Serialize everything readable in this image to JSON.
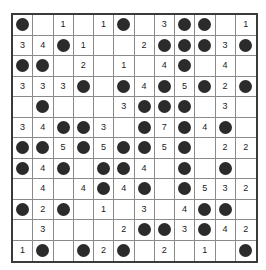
{
  "puzzle": {
    "type": "dot-and-number-grid-puzzle",
    "rows": 12,
    "columns": 12,
    "colors": {
      "dot": "#2b2b2b",
      "cell_background": "#ffffff",
      "inner_grid_line": "#8a8a8a",
      "outer_border": "#3a3a3a",
      "number_text": "#1a1a1a",
      "page_background": "#ffffff"
    },
    "legend": {
      "dot_symbol": "●",
      "blank_symbol": ""
    },
    "cells": [
      [
        "●",
        "",
        "1",
        "",
        "1",
        "●",
        "",
        "3",
        "●",
        "●",
        "",
        "1"
      ],
      [
        "3",
        "4",
        "●",
        "1",
        "",
        "",
        "2",
        "●",
        "●",
        "●",
        "3",
        "●"
      ],
      [
        "●",
        "●",
        "",
        "2",
        "",
        "1",
        "",
        "4",
        "●",
        "",
        "4",
        ""
      ],
      [
        "3",
        "3",
        "3",
        "●",
        "",
        "●",
        "4",
        "●",
        "5",
        "●",
        "2",
        "●"
      ],
      [
        "",
        "●",
        "",
        "",
        "",
        "3",
        "●",
        "●",
        "●",
        "",
        "3",
        ""
      ],
      [
        "3",
        "4",
        "●",
        "●",
        "3",
        "",
        "●",
        "7",
        "●",
        "4",
        "●",
        ""
      ],
      [
        "●",
        "●",
        "5",
        "●",
        "5",
        "●",
        "●",
        "5",
        "●",
        "",
        "2",
        "2"
      ],
      [
        "●",
        "4",
        "●",
        "",
        "●",
        "●",
        "4",
        "",
        "●",
        "",
        "●",
        ""
      ],
      [
        "",
        "4",
        "",
        "4",
        "●",
        "4",
        "●",
        "",
        "●",
        "5",
        "3",
        "2"
      ],
      [
        "●",
        "2",
        "●",
        "",
        "1",
        "",
        "3",
        "",
        "4",
        "●",
        "●",
        ""
      ],
      [
        "",
        "3",
        "",
        "",
        "",
        "2",
        "●",
        "●",
        "3",
        "●",
        "4",
        "2"
      ],
      [
        "1",
        "●",
        "",
        "●",
        "2",
        "●",
        "",
        "2",
        "",
        "1",
        "",
        "●"
      ]
    ]
  }
}
